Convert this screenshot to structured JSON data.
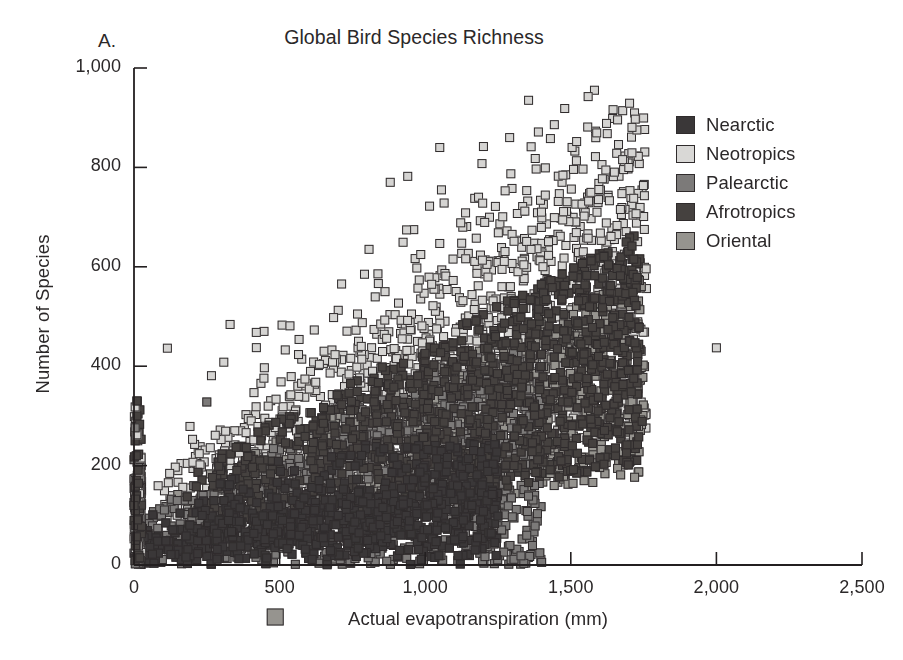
{
  "figure": {
    "panel_label": "A.",
    "background": "#ffffff",
    "text_color": "#2b2829",
    "axis_color": "#231f20"
  },
  "chart_data": {
    "type": "scatter",
    "title": "Global Bird Species Richness",
    "xlabel": "Actual evapotranspiration (mm)",
    "ylabel": "Number of Species",
    "xlim": [
      0,
      2500
    ],
    "ylim": [
      0,
      1000
    ],
    "xticks": [
      0,
      500,
      1000,
      1500,
      2000,
      2500
    ],
    "xtick_labels": [
      "0",
      "500",
      "1,000",
      "1,500",
      "2,000",
      "2,500"
    ],
    "yticks": [
      0,
      200,
      400,
      600,
      800,
      1000
    ],
    "ytick_labels": [
      "0",
      "200",
      "400",
      "600",
      "800",
      "1,000"
    ],
    "grid": false,
    "legend_position": "upper right",
    "marker": "square",
    "marker_size": 9,
    "marker_edge_color": "#2f2b2c",
    "series": [
      {
        "name": "Nearctic",
        "color": "#3a3738",
        "n_points": 900,
        "x_range": [
          0,
          1250
        ],
        "y_range": [
          0,
          240
        ],
        "cluster": "low-dense",
        "seed": 11
      },
      {
        "name": "Neotropics",
        "color": "#d5d4d2",
        "n_points": 1400,
        "x_range": [
          100,
          1800
        ],
        "y_range": [
          60,
          940
        ],
        "cluster": "rising-broad",
        "seed": 23
      },
      {
        "name": "Palearctic",
        "color": "#7c7a79",
        "n_points": 1100,
        "x_range": [
          0,
          1400
        ],
        "y_range": [
          0,
          420
        ],
        "cluster": "low-mid",
        "seed": 37
      },
      {
        "name": "Afrotropics",
        "color": "#45413f",
        "n_points": 1200,
        "x_range": [
          150,
          1800
        ],
        "y_range": [
          80,
          700
        ],
        "cluster": "mid-dense",
        "seed": 53
      },
      {
        "name": "Oriental",
        "color": "#96948f",
        "n_points": 900,
        "x_range": [
          200,
          1800
        ],
        "y_range": [
          80,
          620
        ],
        "cluster": "mid-broad",
        "seed": 71
      }
    ],
    "outliers": [
      {
        "series": "Neotropics",
        "x": 2000,
        "y": 437
      },
      {
        "series": "Afrotropics",
        "x": 1745,
        "y": 289
      },
      {
        "series": "Afrotropics",
        "x": 1700,
        "y": 272
      },
      {
        "series": "Afrotropics",
        "x": 1660,
        "y": 268
      },
      {
        "series": "Nearctic",
        "x": 1200,
        "y": 108
      },
      {
        "series": "Nearctic",
        "x": 1160,
        "y": 120
      },
      {
        "series": "Neotropics",
        "x": 1355,
        "y": 935
      },
      {
        "series": "Neotropics",
        "x": 1290,
        "y": 860
      },
      {
        "series": "Neotropics",
        "x": 1430,
        "y": 858
      },
      {
        "series": "Neotropics",
        "x": 1200,
        "y": 842
      },
      {
        "series": "Neotropics",
        "x": 1520,
        "y": 852
      },
      {
        "series": "Neotropics",
        "x": 1050,
        "y": 840
      },
      {
        "series": "Neotropics",
        "x": 880,
        "y": 770
      },
      {
        "series": "Neotropics",
        "x": 940,
        "y": 782
      },
      {
        "series": "Neotropics",
        "x": 330,
        "y": 484
      },
      {
        "series": "Neotropics",
        "x": 420,
        "y": 468
      },
      {
        "series": "Palearctic",
        "x": 250,
        "y": 328
      },
      {
        "series": "Neotropics",
        "x": 1015,
        "y": 722
      }
    ],
    "stray_marker_below_axis": {
      "series": "Oriental",
      "x": 485,
      "y": -52
    },
    "axis_stack_note": "dense vertical stack of markers at x = 0 reaching y = 330"
  },
  "legend": {
    "items": [
      {
        "label": "Nearctic",
        "color": "#3a3738"
      },
      {
        "label": "Neotropics",
        "color": "#d9d8d6"
      },
      {
        "label": "Palearctic",
        "color": "#7c7a79"
      },
      {
        "label": "Afrotropics",
        "color": "#45413f"
      },
      {
        "label": "Oriental",
        "color": "#96948f"
      }
    ]
  }
}
